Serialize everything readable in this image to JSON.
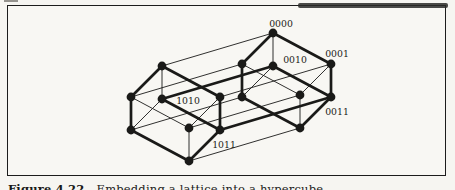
{
  "figure": {
    "caption_prefix": "Figure 4.22",
    "caption_text": "Embedding a lattice into a hypercube",
    "ink_color": "#1a1a18",
    "paper_color": "#f6f5f1"
  },
  "graph": {
    "type": "hypercube-4d-node-graph",
    "node_color": "#1a1a18",
    "edge_color": "#1a1a18",
    "node_radius": 4.4,
    "bold_edge_width": 2.7,
    "thin_edge_width": 0.9,
    "visible_node_labels": [
      "0000",
      "0001",
      "0010",
      "1010",
      "0011",
      "1011"
    ],
    "nodes": [
      {
        "id": "0000",
        "x": 273,
        "y": 33,
        "label": "0000",
        "lx": 281,
        "ly": 27
      },
      {
        "id": "0100",
        "x": 242,
        "y": 64
      },
      {
        "id": "0001",
        "x": 331,
        "y": 64,
        "label": "0001",
        "lx": 337,
        "ly": 57
      },
      {
        "id": "0101",
        "x": 300,
        "y": 95
      },
      {
        "id": "0010",
        "x": 273,
        "y": 66,
        "label": "0010",
        "lx": 295,
        "ly": 63
      },
      {
        "id": "0110",
        "x": 242,
        "y": 97
      },
      {
        "id": "0011",
        "x": 331,
        "y": 97,
        "label": "0011",
        "lx": 337,
        "ly": 115
      },
      {
        "id": "0111",
        "x": 300,
        "y": 128
      },
      {
        "id": "1000",
        "x": 162,
        "y": 66
      },
      {
        "id": "1100",
        "x": 131,
        "y": 97
      },
      {
        "id": "1001",
        "x": 220,
        "y": 97
      },
      {
        "id": "1101",
        "x": 189,
        "y": 128
      },
      {
        "id": "1010",
        "x": 162,
        "y": 99,
        "label": "1010",
        "lx": 188,
        "ly": 104
      },
      {
        "id": "1110",
        "x": 131,
        "y": 130
      },
      {
        "id": "1011",
        "x": 220,
        "y": 130,
        "label": "1011",
        "lx": 224,
        "ly": 148
      },
      {
        "id": "1111",
        "x": 189,
        "y": 161
      }
    ],
    "edges": [
      {
        "from": "0000",
        "to": "0100",
        "bold": true
      },
      {
        "from": "0000",
        "to": "0001",
        "bold": true
      },
      {
        "from": "0100",
        "to": "0101",
        "bold": false
      },
      {
        "from": "0001",
        "to": "0101",
        "bold": false
      },
      {
        "from": "0010",
        "to": "0110",
        "bold": false
      },
      {
        "from": "0010",
        "to": "0011",
        "bold": true
      },
      {
        "from": "0110",
        "to": "0111",
        "bold": true
      },
      {
        "from": "0011",
        "to": "0111",
        "bold": true
      },
      {
        "from": "0000",
        "to": "0010",
        "bold": false
      },
      {
        "from": "0100",
        "to": "0110",
        "bold": true
      },
      {
        "from": "0001",
        "to": "0011",
        "bold": true
      },
      {
        "from": "0101",
        "to": "0111",
        "bold": false
      },
      {
        "from": "1000",
        "to": "1100",
        "bold": true
      },
      {
        "from": "1000",
        "to": "1001",
        "bold": true
      },
      {
        "from": "1100",
        "to": "1101",
        "bold": false
      },
      {
        "from": "1001",
        "to": "1101",
        "bold": false
      },
      {
        "from": "1010",
        "to": "1110",
        "bold": false
      },
      {
        "from": "1010",
        "to": "1011",
        "bold": true
      },
      {
        "from": "1110",
        "to": "1111",
        "bold": true
      },
      {
        "from": "1011",
        "to": "1111",
        "bold": true
      },
      {
        "from": "1000",
        "to": "1010",
        "bold": false
      },
      {
        "from": "1100",
        "to": "1110",
        "bold": true
      },
      {
        "from": "1001",
        "to": "1011",
        "bold": true
      },
      {
        "from": "1101",
        "to": "1111",
        "bold": false
      },
      {
        "from": "1000",
        "to": "0000",
        "bold": false
      },
      {
        "from": "1100",
        "to": "0100",
        "bold": false
      },
      {
        "from": "1001",
        "to": "0001",
        "bold": false
      },
      {
        "from": "1101",
        "to": "0101",
        "bold": false
      },
      {
        "from": "1010",
        "to": "0010",
        "bold": true
      },
      {
        "from": "1110",
        "to": "0110",
        "bold": false
      },
      {
        "from": "1011",
        "to": "0011",
        "bold": true
      },
      {
        "from": "1111",
        "to": "0111",
        "bold": false
      }
    ]
  }
}
